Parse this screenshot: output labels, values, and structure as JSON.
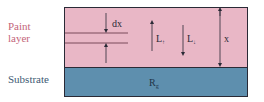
{
  "labels": {
    "paint_line1": "Paint",
    "paint_line2": "layer",
    "substrate": "Substrate"
  },
  "symbols": {
    "dx": "dx",
    "L_up": "L",
    "L_up_sub": "↑",
    "L_down": "L",
    "L_down_sub": "↓",
    "x": "x",
    "Rg": "R",
    "Rg_sub": "g"
  },
  "colors": {
    "paint": "#e9b7c6",
    "substrate": "#5e8fae",
    "outline": "#2a2a36",
    "paint_text": "#c4667a",
    "substrate_text": "#3e5a73"
  }
}
